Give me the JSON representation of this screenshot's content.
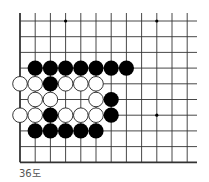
{
  "diagram": {
    "caption": "36도",
    "board": {
      "columns": 12,
      "rows": 10,
      "origin_x": 20,
      "origin_y": 21,
      "spacing_x": 15.2,
      "spacing_y": 15.7,
      "line_extend_right": 197,
      "line_extend_top": 13,
      "edges": [
        "left",
        "bottom"
      ],
      "line_color": "#333333",
      "star_points": [
        {
          "col": 3,
          "row": 0
        },
        {
          "col": 9,
          "row": 0
        },
        {
          "col": 9,
          "row": 6
        }
      ]
    },
    "stones": {
      "black": [
        {
          "col": 1,
          "row": 3
        },
        {
          "col": 2,
          "row": 3
        },
        {
          "col": 3,
          "row": 3
        },
        {
          "col": 4,
          "row": 3
        },
        {
          "col": 5,
          "row": 3
        },
        {
          "col": 6,
          "row": 3
        },
        {
          "col": 7,
          "row": 3
        },
        {
          "col": 2,
          "row": 4
        },
        {
          "col": 6,
          "row": 5
        },
        {
          "col": 2,
          "row": 6
        },
        {
          "col": 6,
          "row": 6
        },
        {
          "col": 1,
          "row": 7
        },
        {
          "col": 2,
          "row": 7
        },
        {
          "col": 3,
          "row": 7
        },
        {
          "col": 4,
          "row": 7
        },
        {
          "col": 5,
          "row": 7
        }
      ],
      "white": [
        {
          "col": 0,
          "row": 4
        },
        {
          "col": 1,
          "row": 4
        },
        {
          "col": 3,
          "row": 4
        },
        {
          "col": 4,
          "row": 4
        },
        {
          "col": 5,
          "row": 4
        },
        {
          "col": 1,
          "row": 5
        },
        {
          "col": 2,
          "row": 5
        },
        {
          "col": 5,
          "row": 5
        },
        {
          "col": 0,
          "row": 6
        },
        {
          "col": 1,
          "row": 6
        },
        {
          "col": 3,
          "row": 6
        },
        {
          "col": 4,
          "row": 6
        },
        {
          "col": 5,
          "row": 6
        }
      ]
    },
    "colors": {
      "black_stone": "#000000",
      "white_stone": "#ffffff",
      "white_stone_outline": "#222222"
    }
  }
}
